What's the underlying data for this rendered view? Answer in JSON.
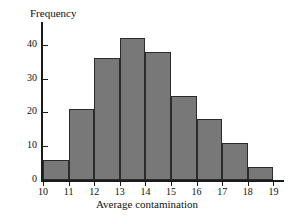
{
  "chart_data": {
    "type": "bar",
    "title": "",
    "subtitle": "",
    "xlabel": "Average contamination",
    "ylabel": "Frequency",
    "categories": [
      "10-11",
      "11-12",
      "12-13",
      "13-14",
      "14-15",
      "15-16",
      "16-17",
      "17-18",
      "18-19"
    ],
    "bin_edges": [
      10,
      11,
      12,
      13,
      14,
      15,
      16,
      17,
      18,
      19
    ],
    "values": [
      6,
      21,
      36,
      42,
      38,
      25,
      18,
      11,
      4
    ],
    "xlim": [
      10,
      19
    ],
    "ylim": [
      0,
      45
    ],
    "x_tick_labels": [
      "10",
      "11",
      "12",
      "13",
      "14",
      "15",
      "16",
      "17",
      "18",
      "19"
    ],
    "y_tick_labels": [
      "0",
      "10",
      "20",
      "30",
      "40"
    ],
    "y_tick_values": [
      0,
      10,
      20,
      30,
      40
    ],
    "grid": false,
    "legend": "none",
    "bar_fill_color": "#787878",
    "bar_edge_color": "#2b2b2b",
    "axis_color": "#1a1a1a",
    "background_color": "#ffffff"
  }
}
